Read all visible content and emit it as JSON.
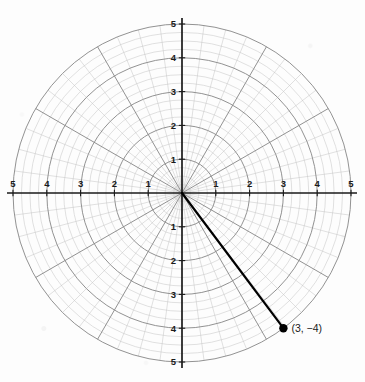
{
  "chart_data": {
    "type": "scatter",
    "title": "",
    "subtitle": "",
    "xlabel": "",
    "ylabel": "",
    "grid": "polar",
    "grid_on": true,
    "legend": "none",
    "xlim": [
      -5,
      5
    ],
    "ylim": [
      -5,
      5
    ],
    "radial_max": 5,
    "radial_minor_step": 0.25,
    "radial_major_step": 1,
    "angular_minor_step_deg": 7.5,
    "angular_major_step_deg": 30,
    "x_tick_labels": [
      "5",
      "4",
      "3",
      "2",
      "1",
      "1",
      "2",
      "3",
      "4",
      "5"
    ],
    "x_tick_values": [
      -5,
      -4,
      -3,
      -2,
      -1,
      1,
      2,
      3,
      4,
      5
    ],
    "y_tick_labels": [
      "5",
      "4",
      "3",
      "2",
      "1",
      "1",
      "2",
      "3",
      "4",
      "5"
    ],
    "y_tick_values": [
      5,
      4,
      3,
      2,
      1,
      -1,
      -2,
      -3,
      -4,
      -5
    ],
    "points": [
      {
        "label": "(3, −4)",
        "x": 3,
        "y": -4
      }
    ],
    "segments": [
      {
        "from": [
          0,
          0
        ],
        "to": [
          3,
          -4
        ]
      }
    ],
    "colors": {
      "axis": "#1a1a1a",
      "grid_major": "#8c8c8c",
      "grid_minor": "#c3c3c3",
      "point": "#000000",
      "segment": "#000000",
      "background": "#fdfdfd",
      "label": "#1a1a1a"
    }
  },
  "annotations": {
    "point_label": "(3, −4)"
  }
}
